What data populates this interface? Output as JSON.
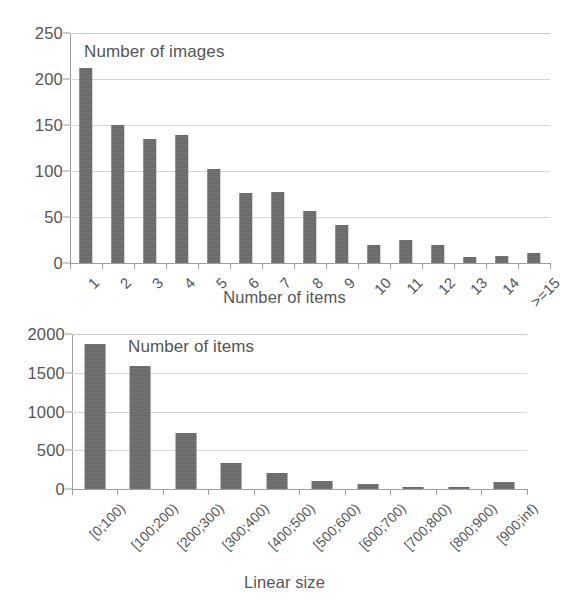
{
  "page": {
    "background": "#ffffff",
    "bar_color": "#6d6d6d",
    "grid_color": "#d6d6d6",
    "axis_color": "#9e9e9e",
    "text_color": "#555555"
  },
  "chart_data": [
    {
      "id": "top",
      "type": "bar",
      "title": "",
      "series_note": "Number of images",
      "xlabel": "Number of items",
      "ylabel": "",
      "ylim": [
        0,
        250
      ],
      "yticks": [
        0,
        50,
        100,
        150,
        200,
        250
      ],
      "ytick_labels": [
        "0",
        "50",
        "100",
        "150",
        "200",
        "250"
      ],
      "grid": true,
      "legend": "none",
      "categories": [
        "1",
        "2",
        "3",
        "4",
        "5",
        "6",
        "7",
        "8",
        "9",
        "10",
        "11",
        "12",
        "13",
        "14",
        ">=15"
      ],
      "values": [
        212,
        150,
        135,
        139,
        102,
        76,
        77,
        56,
        41,
        20,
        25,
        20,
        6,
        8,
        11
      ]
    },
    {
      "id": "bottom",
      "type": "bar",
      "title": "",
      "series_note": "Number of items",
      "xlabel": "Linear size",
      "ylabel": "",
      "ylim": [
        0,
        2000
      ],
      "yticks": [
        0,
        500,
        1000,
        1500,
        2000
      ],
      "ytick_labels": [
        "0",
        "500",
        "1000",
        "1500",
        "2000"
      ],
      "grid": true,
      "legend": "none",
      "categories": [
        "[0;100)",
        "[100;200)",
        "[200;300)",
        "[300;400)",
        "[400;500)",
        "[500;600)",
        "[600;700)",
        "[700;800)",
        "[800;900)",
        "[900;inf)"
      ],
      "values": [
        1870,
        1590,
        720,
        340,
        205,
        100,
        65,
        30,
        25,
        85
      ]
    }
  ]
}
